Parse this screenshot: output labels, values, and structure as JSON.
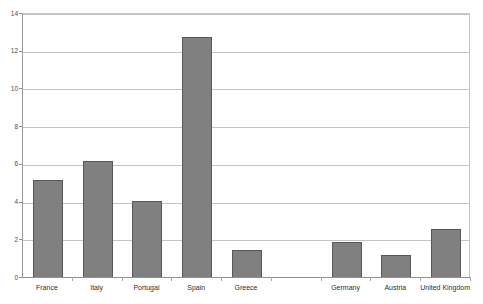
{
  "chart_data": {
    "type": "bar",
    "title": "",
    "xlabel": "",
    "ylabel": "",
    "ylim": [
      0,
      14
    ],
    "ytick_values": [
      0,
      2,
      4,
      6,
      8,
      10,
      12,
      14
    ],
    "ytick_labels": [
      "0",
      "2",
      "4",
      "6",
      "8",
      "10",
      "12",
      "14"
    ],
    "grid": "horizontal",
    "legend": "none",
    "categories": [
      "France",
      "Italy",
      "Portugal",
      "Spain",
      "Greece",
      "",
      "Germany",
      "Austria",
      "United Kingdom"
    ],
    "values": [
      5.2,
      6.2,
      4.1,
      12.8,
      1.5,
      0,
      1.9,
      1.2,
      2.6
    ],
    "series": [
      {
        "name": "",
        "values": [
          5.2,
          6.2,
          4.1,
          12.8,
          1.5,
          0,
          1.9,
          1.2,
          2.6
        ]
      }
    ]
  },
  "style": {
    "bar_fill": "#808080",
    "bar_border": "#585858",
    "gridline_color": "#c4c4c4",
    "axis_color": "#8f8f8f",
    "tick_text_color": "#4a4a4a",
    "category_text_color": "#2e2e2e",
    "plot_background": "#ffffff"
  },
  "title_remnant": {
    "text": ""
  }
}
